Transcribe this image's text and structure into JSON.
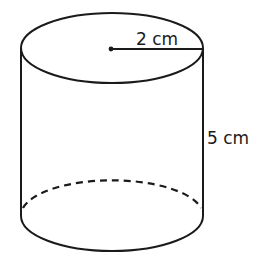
{
  "diagram": {
    "shape": "cylinder",
    "stroke_color": "#1a1a1a",
    "background": "#ffffff",
    "labels": {
      "radius": "2 cm",
      "height": "5 cm"
    },
    "dimensions": {
      "radius": {
        "value": 2,
        "unit": "cm"
      },
      "height": {
        "value": 5,
        "unit": "cm"
      }
    }
  }
}
